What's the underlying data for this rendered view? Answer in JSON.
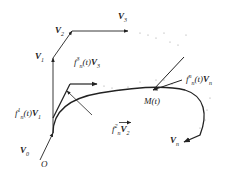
{
  "diagram": {
    "labels": {
      "V0": "V",
      "V0_sub": "0",
      "O": "O",
      "V1": "V",
      "V1_sub": "1",
      "V2": "V",
      "V2_sub": "2",
      "V3": "V",
      "V3_sub": "3",
      "Vn": "V",
      "Vn_sub": "n",
      "Mt": "M(t)",
      "f1_pre": "f",
      "f1_sup": "1",
      "f1_sub": "n",
      "f1_mid": "(t)",
      "f1_vec": "V",
      "f1_vec_sub": "1",
      "f2_pre": "f",
      "f2_sup": "2",
      "f2_sub": "n",
      "f2_vec": "V",
      "f2_vec_sub": "2",
      "f3_pre": "f",
      "f3_sup": "3",
      "f3_sub": "n",
      "f3_mid": "(t)",
      "f3_vec": "V",
      "f3_vec_sub": "3",
      "fn_pre": "f",
      "fn_sup": "n",
      "fn_sub": "n",
      "fn_mid": "(t)",
      "fn_vec": "V",
      "fn_vec_sub": "n"
    },
    "colors": {
      "stroke": "#222222",
      "dots": "#9a9a9a",
      "background": "#ffffff"
    }
  }
}
